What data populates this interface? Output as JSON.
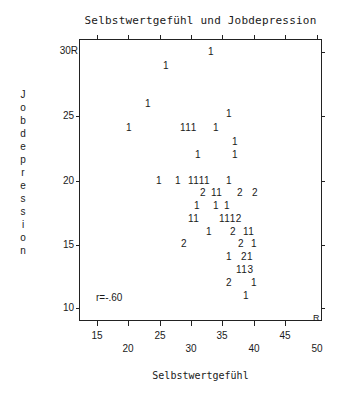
{
  "chart_data": {
    "type": "scatter",
    "title": "Selbstwertgefühl und Jobdepression",
    "xlabel": "Selbstwertgefühl",
    "ylabel": "Jobdepression",
    "xlim": [
      12,
      50
    ],
    "ylim": [
      9,
      31
    ],
    "x_ticks": [
      15,
      20,
      25,
      30,
      35,
      40,
      45,
      50
    ],
    "y_ticks": [
      10,
      15,
      20,
      25,
      30
    ],
    "grid": false,
    "legend": null,
    "marker": "count digits (number of cases at position)",
    "annotation": "r=-.60",
    "points": [
      {
        "x": 33,
        "y": 30,
        "n": 1
      },
      {
        "x": 26,
        "y": 29,
        "n": 1
      },
      {
        "x": 23,
        "y": 26,
        "n": 1
      },
      {
        "x": 36,
        "y": 25,
        "n": 1
      },
      {
        "x": 20,
        "y": 24,
        "n": 1
      },
      {
        "x": 29,
        "y": 24,
        "n": 1
      },
      {
        "x": 30,
        "y": 24,
        "n": 1
      },
      {
        "x": 31,
        "y": 24,
        "n": 1
      },
      {
        "x": 34,
        "y": 24,
        "n": 1
      },
      {
        "x": 37,
        "y": 23,
        "n": 1
      },
      {
        "x": 31,
        "y": 22,
        "n": 1
      },
      {
        "x": 37,
        "y": 22,
        "n": 1
      },
      {
        "x": 25,
        "y": 20,
        "n": 1
      },
      {
        "x": 28,
        "y": 20,
        "n": 1
      },
      {
        "x": 30,
        "y": 20,
        "n": 1
      },
      {
        "x": 31,
        "y": 20,
        "n": 1
      },
      {
        "x": 32,
        "y": 20,
        "n": 1
      },
      {
        "x": 33,
        "y": 20,
        "n": 1
      },
      {
        "x": 36,
        "y": 20,
        "n": 1
      },
      {
        "x": 32,
        "y": 19,
        "n": 2
      },
      {
        "x": 34,
        "y": 19,
        "n": 1
      },
      {
        "x": 35,
        "y": 19,
        "n": 1
      },
      {
        "x": 38,
        "y": 19,
        "n": 2
      },
      {
        "x": 40,
        "y": 19,
        "n": 2
      },
      {
        "x": 31,
        "y": 18,
        "n": 1
      },
      {
        "x": 34,
        "y": 18,
        "n": 1
      },
      {
        "x": 36,
        "y": 18,
        "n": 1
      },
      {
        "x": 30,
        "y": 17,
        "n": 1
      },
      {
        "x": 31,
        "y": 17,
        "n": 1
      },
      {
        "x": 35,
        "y": 17,
        "n": 1
      },
      {
        "x": 36,
        "y": 17,
        "n": 1
      },
      {
        "x": 37,
        "y": 17,
        "n": 1
      },
      {
        "x": 38,
        "y": 17,
        "n": 2
      },
      {
        "x": 33,
        "y": 16,
        "n": 1
      },
      {
        "x": 37,
        "y": 16,
        "n": 2
      },
      {
        "x": 39,
        "y": 16,
        "n": 1
      },
      {
        "x": 40,
        "y": 16,
        "n": 1
      },
      {
        "x": 29,
        "y": 15,
        "n": 2
      },
      {
        "x": 38,
        "y": 15,
        "n": 2
      },
      {
        "x": 40,
        "y": 15,
        "n": 1
      },
      {
        "x": 36,
        "y": 14,
        "n": 1
      },
      {
        "x": 39,
        "y": 14,
        "n": 2
      },
      {
        "x": 40,
        "y": 14,
        "n": 1
      },
      {
        "x": 38,
        "y": 13,
        "n": 1
      },
      {
        "x": 39,
        "y": 13,
        "n": 1
      },
      {
        "x": 40,
        "y": 13,
        "n": 3
      },
      {
        "x": 36,
        "y": 12,
        "n": 2
      },
      {
        "x": 40,
        "y": 12,
        "n": 1
      },
      {
        "x": 39,
        "y": 11,
        "n": 1
      }
    ]
  },
  "labels": {
    "title": "Selbstwertgefühl und Jobdepression",
    "xtitle": "Selbstwertgefühl",
    "ytitle_chars": [
      "J",
      "o",
      "b",
      "d",
      "e",
      "p",
      "r",
      "e",
      "s",
      "s",
      "i",
      "o",
      "n"
    ],
    "y_ticks": [
      "30R",
      "25",
      "20",
      "15",
      "10"
    ],
    "x_ticks_upper": [
      "15",
      "25",
      "35",
      "45"
    ],
    "x_ticks_lower": [
      "20",
      "30",
      "40",
      "50"
    ],
    "corner_marker": "R",
    "correlation": "r=-.60"
  },
  "symbol_rows": [
    {
      "top": 47,
      "items": [
        {
          "x": 208,
          "t": "1"
        }
      ]
    },
    {
      "top": 61,
      "items": [
        {
          "x": 163,
          "t": "1"
        }
      ]
    },
    {
      "top": 99,
      "items": [
        {
          "x": 145,
          "t": "1"
        }
      ]
    },
    {
      "top": 109,
      "items": [
        {
          "x": 226,
          "t": "1"
        }
      ]
    },
    {
      "top": 123,
      "items": [
        {
          "x": 126,
          "t": "1"
        },
        {
          "x": 180,
          "t": "111"
        },
        {
          "x": 213,
          "t": "1"
        }
      ]
    },
    {
      "top": 137,
      "items": [
        {
          "x": 232,
          "t": "1"
        }
      ]
    },
    {
      "top": 150,
      "items": [
        {
          "x": 195,
          "t": "1"
        },
        {
          "x": 232,
          "t": "1"
        }
      ]
    },
    {
      "top": 176,
      "items": [
        {
          "x": 156,
          "t": "1"
        },
        {
          "x": 175,
          "t": "1"
        },
        {
          "x": 188,
          "t": "1111"
        },
        {
          "x": 226,
          "t": "1"
        }
      ]
    },
    {
      "top": 188,
      "items": [
        {
          "x": 200,
          "t": "2"
        },
        {
          "x": 211,
          "t": "11"
        },
        {
          "x": 237,
          "t": "2"
        },
        {
          "x": 252,
          "t": "2"
        }
      ]
    },
    {
      "top": 201,
      "items": [
        {
          "x": 194,
          "t": "1"
        },
        {
          "x": 213,
          "t": "1"
        },
        {
          "x": 224,
          "t": "1"
        }
      ]
    },
    {
      "top": 214,
      "items": [
        {
          "x": 188,
          "t": "11"
        },
        {
          "x": 219,
          "t": "1112"
        }
      ]
    },
    {
      "top": 227,
      "items": [
        {
          "x": 206,
          "t": "1"
        },
        {
          "x": 230,
          "t": "2"
        },
        {
          "x": 243,
          "t": "11"
        }
      ]
    },
    {
      "top": 239,
      "items": [
        {
          "x": 181,
          "t": "2"
        },
        {
          "x": 238,
          "t": "2"
        },
        {
          "x": 251,
          "t": "1"
        }
      ]
    },
    {
      "top": 252,
      "items": [
        {
          "x": 226,
          "t": "1"
        },
        {
          "x": 241,
          "t": "21"
        }
      ]
    },
    {
      "top": 265,
      "items": [
        {
          "x": 236,
          "t": "113"
        }
      ]
    },
    {
      "top": 278,
      "items": [
        {
          "x": 226,
          "t": "2"
        },
        {
          "x": 251,
          "t": "1"
        }
      ]
    },
    {
      "top": 291,
      "items": [
        {
          "x": 243,
          "t": "1"
        }
      ]
    }
  ]
}
